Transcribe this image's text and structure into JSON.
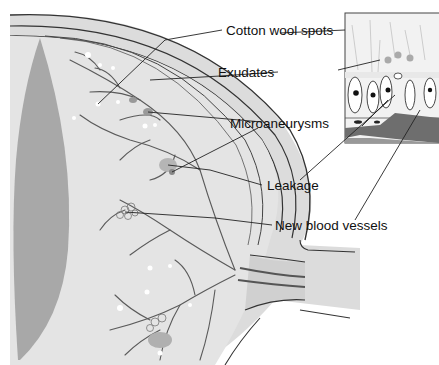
{
  "diagram": {
    "labels": [
      {
        "id": "cotton-wool-spots",
        "text": "Cotton wool spots"
      },
      {
        "id": "exudates",
        "text": "Exudates"
      },
      {
        "id": "microaneurysms",
        "text": "Microaneurysms"
      },
      {
        "id": "leakage",
        "text": "Leakage"
      },
      {
        "id": "new-blood-vessels",
        "text": "New blood vessels"
      }
    ],
    "colors": {
      "background": "#ffffff",
      "sclera": "#d9d9d9",
      "retina_fill": "#e2e2e2",
      "lens": "#a9a9a9",
      "vessel": "#555555",
      "outline": "#333333",
      "inset_dark": "#6e6e6e"
    }
  }
}
